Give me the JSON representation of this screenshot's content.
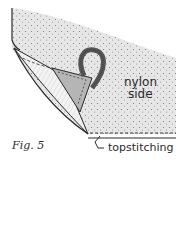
{
  "figure": {
    "label": "Fig. 5",
    "annotations": {
      "nylon": "nylon",
      "side": "side",
      "topstitching": "topstitching"
    }
  },
  "colors": {
    "ink": "#2b2b2b",
    "fabric_fill": "#e4e4e4",
    "lining_fill": "#f2f2f2",
    "loop_fill": "#6a6a6a",
    "background": "#ffffff"
  }
}
